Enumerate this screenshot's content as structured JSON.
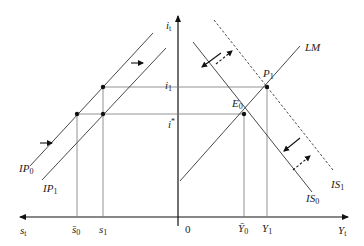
{
  "diagram": {
    "type": "IS-LM-IP four-quadrant economics diagram",
    "axes": {
      "vertical": {
        "label": "i",
        "sub": "t"
      },
      "horizontal_right": {
        "label": "Y",
        "sub": "t"
      },
      "horizontal_left": {
        "label": "s",
        "sub": "t"
      },
      "origin": "0"
    },
    "curves": {
      "LM": {
        "label": "LM"
      },
      "IS0": {
        "label": "IS",
        "sub": "0"
      },
      "IS1": {
        "label": "IS",
        "sub": "1",
        "style": "dashed"
      },
      "IP0": {
        "label": "IP",
        "sub": "0"
      },
      "IP1": {
        "label": "IP",
        "sub": "1"
      }
    },
    "points": {
      "E0": {
        "label": "E",
        "sub": "0"
      },
      "P1": {
        "label": "P",
        "sub": "1"
      }
    },
    "ticks": {
      "i1": {
        "label": "i",
        "sub": "1"
      },
      "istar": {
        "label": "i",
        "sup": "*"
      },
      "s0bar": {
        "label": "s̄",
        "sub": "0"
      },
      "s1": {
        "label": "s",
        "sub": "1"
      },
      "Y0bar": {
        "label": "Ȳ",
        "sub": "0"
      },
      "Y1": {
        "label": "Y",
        "sub": "1"
      }
    },
    "colors": {
      "line": "#333333",
      "guide": "#777777"
    }
  }
}
